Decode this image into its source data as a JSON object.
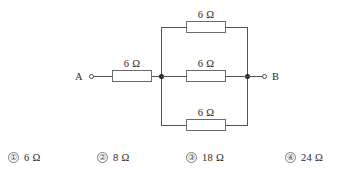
{
  "diagram": {
    "terminals": [
      {
        "name": "A",
        "label": "A"
      },
      {
        "name": "B",
        "label": "B"
      }
    ],
    "series_resistor": {
      "label": "6 Ω",
      "value": 6,
      "unit": "Ω"
    },
    "parallel_branches": [
      {
        "position": "top",
        "label": "6 Ω",
        "value": 6,
        "unit": "Ω"
      },
      {
        "position": "middle",
        "label": "6 Ω",
        "value": 6,
        "unit": "Ω"
      },
      {
        "position": "bottom",
        "label": "6 Ω",
        "value": 6,
        "unit": "Ω"
      }
    ],
    "colors": {
      "wire": "#555356",
      "resistor_border": "#6b6a6c",
      "node": "#222124",
      "text": "#2a2829",
      "background": "#ffffff"
    }
  },
  "options": [
    {
      "number": "①",
      "text": "6 Ω",
      "value": 6,
      "unit": "Ω"
    },
    {
      "number": "②",
      "text": "8 Ω",
      "value": 8,
      "unit": "Ω"
    },
    {
      "number": "③",
      "text": "18 Ω",
      "value": 18,
      "unit": "Ω"
    },
    {
      "number": "④",
      "text": "24 Ω",
      "value": 24,
      "unit": "Ω"
    }
  ]
}
